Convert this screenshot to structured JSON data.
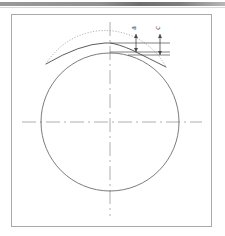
{
  "page": {
    "background_color": "#ffffff",
    "top_rule_color": "#8f8f8f"
  },
  "frame": {
    "border_color": "#a9a9a9",
    "x": 11,
    "y": 14,
    "width": 201,
    "height": 213
  },
  "figure": {
    "type": "engineering-drawing",
    "line_color": "#555555",
    "dotted_color": "#8a8a8a",
    "centerline_color": "#9a9a9a",
    "circle": {
      "center_x": 110,
      "center_y": 122,
      "radius": 69
    },
    "profile": {
      "apex_x": 110,
      "apex_y": 45,
      "left_x": 46,
      "left_y": 64,
      "right_x": 166,
      "right_y": 67
    },
    "dimensions": [
      {
        "name": "dim-a",
        "label": "a",
        "x": 136,
        "top_y": 32,
        "bottom_y": 52
      },
      {
        "name": "dim-b",
        "label": "c",
        "x": 160,
        "top_y": 32,
        "bottom_y": 55
      }
    ],
    "centerlines": {
      "vertical_top": 22,
      "vertical_bottom": 216,
      "horizontal_left": 22,
      "horizontal_right": 202,
      "x": 110,
      "y": 122
    }
  },
  "labels": {
    "dim_a": "a",
    "dim_c": "c"
  }
}
